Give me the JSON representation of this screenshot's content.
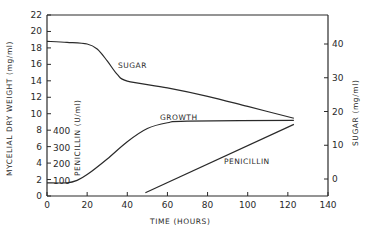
{
  "chart_data": {
    "type": "line",
    "title": "",
    "xlabel": "TIME (HOURS)",
    "ylabel_left": "MYCELIAL DRY WEIGHT (mg/ml)",
    "ylabel_left_inner": "PENICILLIN (U/ml)",
    "ylabel_right": "SUGAR (mg/ml)",
    "xlim": [
      0,
      140
    ],
    "ylim_left": [
      0,
      22
    ],
    "ylim_penicillin": [
      0,
      1200
    ],
    "ylim_right": [
      -5,
      48
    ],
    "x_ticks": [
      "0",
      "20",
      "40",
      "60",
      "80",
      "100",
      "120",
      "140"
    ],
    "y_left_ticks": [
      "0",
      "2",
      "4",
      "6",
      "8",
      "10",
      "12",
      "14",
      "16",
      "18",
      "20",
      "22"
    ],
    "y_penicillin_ticks": [
      "100",
      "200",
      "300",
      "400"
    ],
    "y_right_ticks": [
      "0",
      "10",
      "20",
      "30",
      "40"
    ],
    "grid": false,
    "legend": "none",
    "annotations": [
      "SUGAR",
      "GROWTH",
      "PENICILLIN"
    ],
    "series": [
      {
        "name": "SUGAR",
        "axis": "right",
        "x": [
          0,
          10,
          20,
          25,
          30,
          35,
          40,
          60,
          80,
          100,
          123
        ],
        "values": [
          40.8,
          40.5,
          40.0,
          38.5,
          35.0,
          31.0,
          29.0,
          27.0,
          24.5,
          21.5,
          18.0
        ]
      },
      {
        "name": "GROWTH",
        "axis": "left",
        "x": [
          0,
          10,
          15,
          20,
          30,
          40,
          50,
          60,
          70,
          123
        ],
        "values": [
          1.6,
          1.6,
          1.9,
          2.6,
          4.5,
          6.6,
          8.2,
          8.9,
          9.1,
          9.2
        ]
      },
      {
        "name": "PENICILLIN",
        "axis": "penicillin",
        "x": [
          49,
          123
        ],
        "values": [
          30,
          440
        ]
      }
    ]
  }
}
